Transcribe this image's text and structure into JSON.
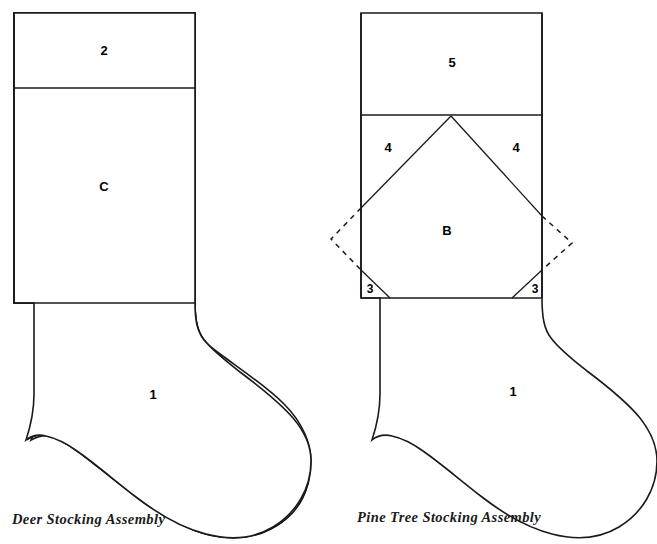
{
  "page": {
    "background_color": "#ffffff",
    "line_color": "#1a1a1a",
    "width": 657,
    "height": 544
  },
  "diagrams": [
    {
      "id": "deer-stocking",
      "caption": "Deer Stocking Assembly",
      "caption_x": 12,
      "caption_y": 524,
      "pieces": [
        {
          "name": "cuff",
          "label": "2",
          "x": 104,
          "y": 52
        },
        {
          "name": "leg",
          "label": "C",
          "x": 104,
          "y": 188
        },
        {
          "name": "foot",
          "label": "1",
          "x": 153,
          "y": 396
        }
      ],
      "geometry": {
        "left_edge_x": 14,
        "right_edge_x": 195,
        "top_y": 13,
        "cuff_divider_y": 88,
        "leg_divider_y": 303,
        "toe_bottom_y": 537,
        "heel_max_x": 311
      }
    },
    {
      "id": "pine-tree-stocking",
      "caption": "Pine Tree Stocking Assembly",
      "caption_x": 357,
      "caption_y": 522,
      "pieces": [
        {
          "name": "cuff",
          "label": "5",
          "x": 452,
          "y": 64
        },
        {
          "name": "tree-left",
          "label": "4",
          "x": 388,
          "y": 149
        },
        {
          "name": "tree-right",
          "label": "4",
          "x": 516,
          "y": 149
        },
        {
          "name": "body",
          "label": "B",
          "x": 447,
          "y": 232
        },
        {
          "name": "corner-left",
          "label": "3",
          "x": 370,
          "y": 290
        },
        {
          "name": "corner-right",
          "label": "3",
          "x": 535,
          "y": 290
        },
        {
          "name": "foot",
          "label": "1",
          "x": 513,
          "y": 393
        }
      ],
      "geometry": {
        "left_edge_x": 361,
        "right_edge_x": 542,
        "top_y": 13,
        "cuff_divider_y": 115,
        "apex_x": 451,
        "apex_y": 116,
        "diagonal_left_y": 208,
        "diagonal_right_y": 216,
        "corner_start_y": 270,
        "body_bottom_y": 298,
        "toe_bottom_y": 537,
        "heel_max_x": 645,
        "dashed_left_tip_x": 331,
        "dashed_right_tip_x": 572,
        "dashed_tip_y": 239
      }
    }
  ]
}
